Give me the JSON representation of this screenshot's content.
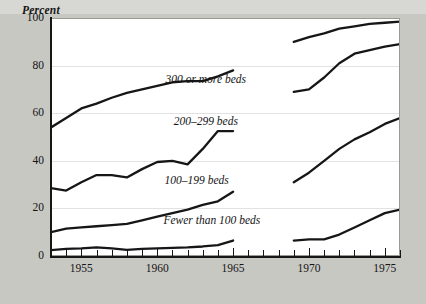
{
  "chart_data": {
    "type": "line",
    "title": "",
    "ylabel": "Percent",
    "xlabel": "",
    "ylim": [
      0,
      100
    ],
    "xlim": [
      1953,
      1976
    ],
    "yticks": [
      0,
      20,
      40,
      60,
      80,
      100
    ],
    "xticks": [
      1955,
      1960,
      1965,
      1970,
      1975
    ],
    "grid": "horizontal-faint",
    "legend_position": "inline-annotations",
    "note": "Each series is drawn as two segments with a data break between 1965 and 1969.",
    "series": [
      {
        "name": "300 or more beds",
        "label": "300 or more beds",
        "label_x": 1963.2,
        "label_y": 74,
        "segments": [
          {
            "x": [
              1953,
              1954,
              1955,
              1956,
              1957,
              1958,
              1959,
              1960,
              1961,
              1962,
              1963,
              1964,
              1965
            ],
            "y": [
              54,
              58,
              62,
              64,
              66.5,
              68.5,
              70,
              71.5,
              73,
              73.5,
              73.5,
              75.5,
              78
            ]
          },
          {
            "x": [
              1969,
              1970,
              1971,
              1972,
              1973,
              1974,
              1975,
              1976
            ],
            "y": [
              90,
              92,
              93.5,
              95.5,
              96.5,
              97.5,
              98,
              98.5
            ]
          }
        ]
      },
      {
        "name": "200-299 beds",
        "label": "200–299 beds",
        "label_x": 1963.2,
        "label_y": 56.5,
        "segments": [
          {
            "x": [
              1953,
              1954,
              1955,
              1956,
              1957,
              1958,
              1959,
              1960,
              1961,
              1962,
              1963,
              1964,
              1965
            ],
            "y": [
              28.5,
              27.5,
              31,
              34,
              34,
              33,
              36.5,
              39.5,
              40,
              38.5,
              45,
              52.5,
              52.5
            ]
          },
          {
            "x": [
              1969,
              1970,
              1971,
              1972,
              1973,
              1974,
              1975,
              1976
            ],
            "y": [
              69,
              70,
              75,
              81,
              85,
              86.5,
              88,
              89
            ]
          }
        ]
      },
      {
        "name": "100-199 beds",
        "label": "100–199 beds",
        "label_x": 1962.6,
        "label_y": 31.5,
        "segments": [
          {
            "x": [
              1953,
              1954,
              1955,
              1956,
              1957,
              1958,
              1959,
              1960,
              1961,
              1962,
              1963,
              1964,
              1965
            ],
            "y": [
              10,
              11.5,
              12,
              12.5,
              13,
              13.5,
              15,
              16.5,
              18,
              19.5,
              21.5,
              23,
              27
            ]
          },
          {
            "x": [
              1969,
              1970,
              1971,
              1972,
              1973,
              1974,
              1975,
              1976
            ],
            "y": [
              31,
              35,
              40,
              45,
              49,
              52,
              55.5,
              58
            ]
          }
        ]
      },
      {
        "name": "Fewer than 100 beds",
        "label": "Fewer than 100 beds",
        "label_x": 1963.6,
        "label_y": 14.5,
        "segments": [
          {
            "x": [
              1953,
              1954,
              1955,
              1956,
              1957,
              1958,
              1959,
              1960,
              1961,
              1962,
              1963,
              1964,
              1965
            ],
            "y": [
              2.5,
              3,
              3.2,
              3.6,
              3.2,
              2.6,
              3,
              3.2,
              3.4,
              3.6,
              4,
              4.6,
              6.5
            ]
          },
          {
            "x": [
              1969,
              1970,
              1971,
              1972,
              1973,
              1974,
              1975,
              1976
            ],
            "y": [
              6.5,
              7,
              7,
              9,
              12,
              15,
              18,
              19.5
            ]
          }
        ]
      }
    ],
    "colors": {
      "line": "#161616",
      "grid": "#e2e2e2",
      "axis": "#161616",
      "plot_background": "#ffffff",
      "page_background": "#c8c8c3"
    }
  }
}
